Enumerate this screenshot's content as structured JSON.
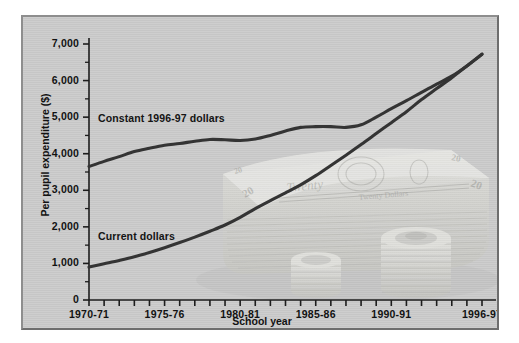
{
  "chart_data": {
    "type": "line",
    "title": "",
    "xlabel": "School year",
    "ylabel": "Per pupil expenditure ($)",
    "ylim": [
      0,
      7000
    ],
    "yticks": [
      "0",
      "1,000",
      "2,000",
      "3,000",
      "4,000",
      "5,000",
      "6,000",
      "7,000"
    ],
    "ytick_values": [
      0,
      1000,
      2000,
      3000,
      4000,
      5000,
      6000,
      7000
    ],
    "y_minor_tick_step": 500,
    "grid": false,
    "legend_position": "inline-annotations",
    "x": [
      "1970-71",
      "1971-72",
      "1972-73",
      "1973-74",
      "1974-75",
      "1975-76",
      "1976-77",
      "1977-78",
      "1978-79",
      "1979-80",
      "1980-81",
      "1981-82",
      "1982-83",
      "1983-84",
      "1984-85",
      "1985-86",
      "1986-87",
      "1987-88",
      "1988-89",
      "1989-90",
      "1990-91",
      "1991-92",
      "1992-93",
      "1993-94",
      "1994-95",
      "1995-96",
      "1996-97"
    ],
    "xtick_labels": [
      "1970-71",
      "1975-76",
      "1980-81",
      "1985-86",
      "1990-91",
      "1996-97"
    ],
    "xtick_label_indices": [
      0,
      5,
      10,
      15,
      20,
      26
    ],
    "series": [
      {
        "name": "Constant 1996-97 dollars",
        "color": "#343434",
        "values": [
          3650,
          3790,
          3920,
          4060,
          4150,
          4230,
          4280,
          4340,
          4390,
          4380,
          4360,
          4400,
          4500,
          4620,
          4720,
          4740,
          4740,
          4720,
          4790,
          5000,
          5230,
          5450,
          5680,
          5900,
          6120,
          6400,
          6720
        ]
      },
      {
        "name": "Current dollars",
        "color": "#343434",
        "values": [
          900,
          990,
          1080,
          1180,
          1300,
          1430,
          1570,
          1720,
          1880,
          2050,
          2260,
          2500,
          2720,
          2930,
          3150,
          3400,
          3680,
          3960,
          4250,
          4550,
          4850,
          5150,
          5480,
          5780,
          6080,
          6400,
          6720
        ]
      }
    ],
    "annotations": [
      {
        "text": "Constant 1996-97 dollars",
        "x_index": 1,
        "y_value": 4950
      },
      {
        "text": "Current dollars",
        "x_index": 1,
        "y_value": 1720
      }
    ]
  },
  "watermark": {
    "name": "stack-of-twenty-dollar-bills-and-coins",
    "bill_text_twenty": "Twenty",
    "bill_text_twenty_dollars": "Twenty Dollars",
    "bill_denomination": "20"
  },
  "colors": {
    "background": "#c9c9c9",
    "line": "#343434",
    "axis": "#1d1d1d",
    "text": "#121212"
  }
}
